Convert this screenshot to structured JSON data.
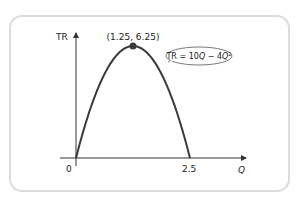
{
  "chart_data": {
    "type": "line",
    "title": "",
    "xlabel": "Q",
    "ylabel": "TR",
    "xlim": [
      0,
      2.9
    ],
    "ylim": [
      0,
      6.9
    ],
    "x_ticks": [
      {
        "value": 0,
        "label": "0"
      },
      {
        "value": 2.5,
        "label": "2.5"
      }
    ],
    "series": [
      {
        "name": "TR = 10Q − 4Q²",
        "function": "10Q - 4Q^2",
        "x_range": [
          0,
          2.5
        ],
        "color": "#3a3a3a"
      }
    ],
    "annotations": [
      {
        "type": "point",
        "x": 1.25,
        "y": 6.25,
        "label": "(1.25, 6.25)"
      },
      {
        "type": "callout",
        "text_main": "TR = 10",
        "text_var1": "Q",
        "text_mid": " − 4",
        "text_var2": "Q",
        "text_sup": "2",
        "target_x": 1.72
      }
    ],
    "grid": false
  }
}
